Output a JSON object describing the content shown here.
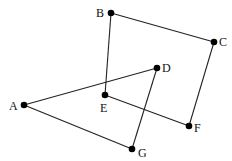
{
  "diagram": {
    "type": "graph",
    "nodes": [
      {
        "id": "A",
        "label": "A",
        "x": 24,
        "y": 105,
        "lx": 9,
        "ly": 110
      },
      {
        "id": "B",
        "label": "B",
        "x": 111,
        "y": 13,
        "lx": 96,
        "ly": 17
      },
      {
        "id": "C",
        "label": "C",
        "x": 214,
        "y": 42,
        "lx": 219,
        "ly": 46
      },
      {
        "id": "D",
        "label": "D",
        "x": 157,
        "y": 68,
        "lx": 162,
        "ly": 72
      },
      {
        "id": "E",
        "label": "E",
        "x": 105,
        "y": 95,
        "lx": 100,
        "ly": 112
      },
      {
        "id": "F",
        "label": "F",
        "x": 189,
        "y": 126,
        "lx": 194,
        "ly": 132
      },
      {
        "id": "G",
        "label": "G",
        "x": 132,
        "y": 149,
        "lx": 138,
        "ly": 157
      }
    ],
    "edges": [
      [
        "B",
        "C"
      ],
      [
        "B",
        "E"
      ],
      [
        "C",
        "F"
      ],
      [
        "E",
        "F"
      ],
      [
        "A",
        "D"
      ],
      [
        "A",
        "G"
      ],
      [
        "D",
        "G"
      ]
    ],
    "colors": {
      "line": "#222222",
      "node": "#000000",
      "label": "#111111"
    }
  }
}
